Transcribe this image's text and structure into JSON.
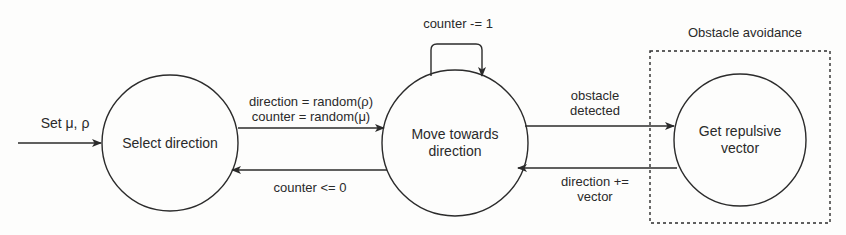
{
  "diagram": {
    "colors": {
      "stroke": "#2b2b2b",
      "text": "#2a2a2a",
      "background": "#fdfdfc"
    },
    "entry": {
      "label": "Set μ, ρ"
    },
    "nodes": [
      {
        "id": "select",
        "label": "Select direction"
      },
      {
        "id": "move",
        "label": "Move towards direction",
        "line1": "Move towards",
        "line2": "direction"
      },
      {
        "id": "repulsive",
        "label": "Get repulsive vector",
        "line1": "Get repulsive",
        "line2": "vector"
      }
    ],
    "edges": {
      "select_to_move": {
        "line1": "direction = random(ρ)",
        "line2": "counter = random(μ)"
      },
      "move_self_loop": {
        "label": "counter -= 1"
      },
      "move_to_select": {
        "label": "counter <= 0"
      },
      "move_to_repulsive": {
        "line1": "obstacle",
        "line2": "detected"
      },
      "repulsive_to_move": {
        "line1": "direction +=",
        "line2": "vector"
      }
    },
    "group": {
      "label": "Obstacle avoidance"
    }
  }
}
